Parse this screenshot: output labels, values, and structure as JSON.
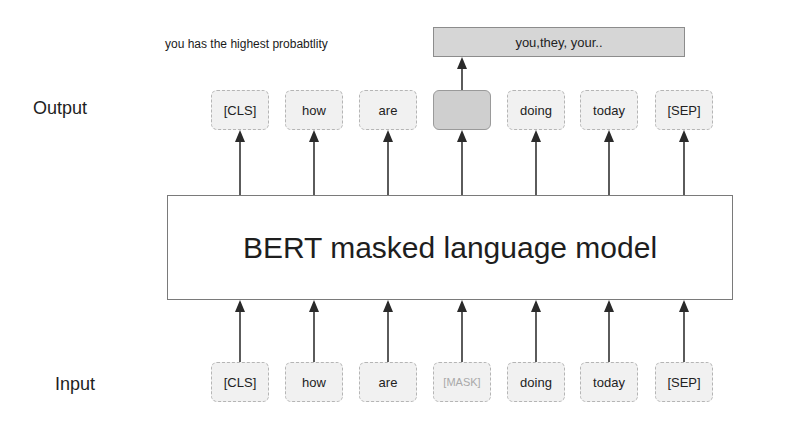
{
  "labels": {
    "output": "Output",
    "input": "Input"
  },
  "prediction": {
    "hint": "you has the highest probabtlity",
    "result": "you,they, your.."
  },
  "model": {
    "title": "BERT masked language model"
  },
  "output_tokens": [
    {
      "text": "[CLS]",
      "masked": false
    },
    {
      "text": "how",
      "masked": false
    },
    {
      "text": "are",
      "masked": false
    },
    {
      "text": "",
      "masked": true
    },
    {
      "text": "doing",
      "masked": false
    },
    {
      "text": "today",
      "masked": false
    },
    {
      "text": "[SEP]",
      "masked": false
    }
  ],
  "input_tokens": [
    {
      "text": "[CLS]",
      "masked": false
    },
    {
      "text": "how",
      "masked": false
    },
    {
      "text": "are",
      "masked": false
    },
    {
      "text": "[MASK]",
      "masked": true
    },
    {
      "text": "doing",
      "masked": false
    },
    {
      "text": "today",
      "masked": false
    },
    {
      "text": "[SEP]",
      "masked": false
    }
  ],
  "colors": {
    "token_fill": "#f1f1f1",
    "masked_fill": "#cfcfcf",
    "result_fill": "#d6d6d6",
    "arrow": "#333333",
    "mask_text": "#a9a9a9"
  }
}
